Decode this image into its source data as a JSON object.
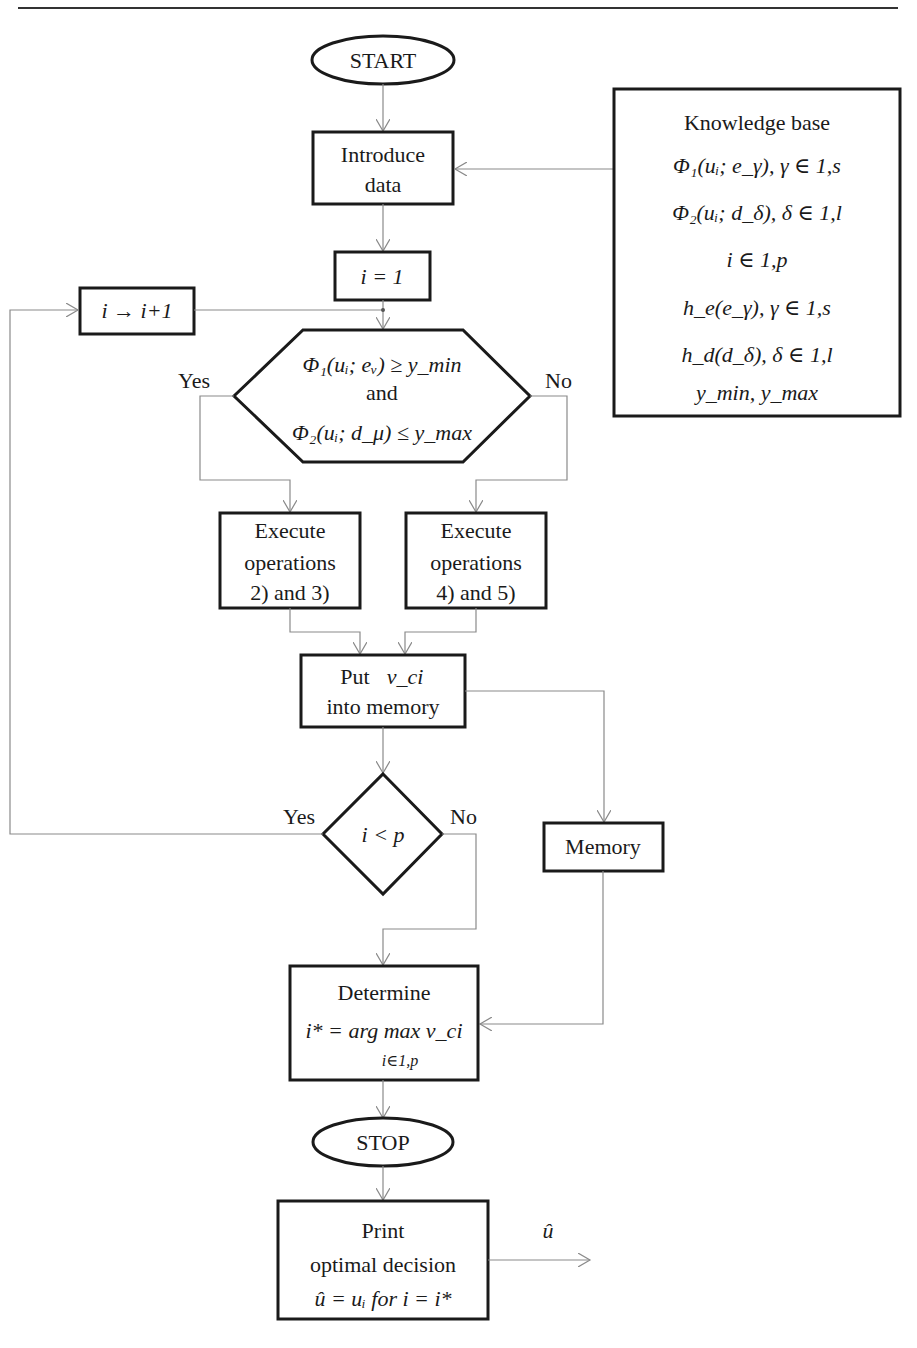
{
  "flowchart": {
    "start": "START",
    "introduce": {
      "line1": "Introduce",
      "line2": "data"
    },
    "init": "i = 1",
    "increment": "i → i+1",
    "condition": {
      "line1": "Φ₁(uᵢ; eᵥ) ≥ y_min",
      "and": "and",
      "line2": "Φ₂(uᵢ; d_μ) ≤ y_max",
      "yes": "Yes",
      "no": "No"
    },
    "exec_yes": {
      "line1": "Execute",
      "line2": "operations",
      "line3": "2) and 3)"
    },
    "exec_no": {
      "line1": "Execute",
      "line2": "operations",
      "line3": "4) and 5)"
    },
    "put": {
      "line1": "Put",
      "var": "v_ci",
      "line2": "into memory"
    },
    "loop_cond": {
      "text": "i < p",
      "yes": "Yes",
      "no": "No"
    },
    "memory": "Memory",
    "determine": {
      "line1": "Determine",
      "formula": "i* = arg max v_ci",
      "sub": "i∈1,p"
    },
    "stop": "STOP",
    "print": {
      "line1": "Print",
      "line2": "optimal decision",
      "line3": "û = uᵢ  for  i = i*"
    },
    "output_label": "û"
  },
  "knowledge_base": {
    "title": "Knowledge base",
    "items": [
      "Φ₁(uᵢ; e_γ), γ ∈ 1,s",
      "Φ₂(uᵢ; d_δ), δ ∈ 1,l",
      "i ∈ 1,p",
      "h_e(e_γ), γ ∈ 1,s",
      "h_d(d_δ), δ ∈ 1,l",
      "y_min, y_max"
    ]
  }
}
